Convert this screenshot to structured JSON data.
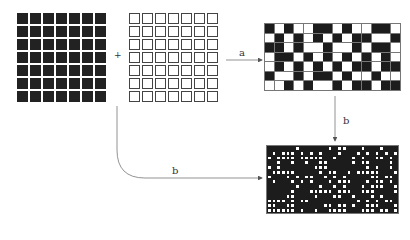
{
  "diagram": {
    "operator": "+",
    "arrow_a_label": "a",
    "arrow_b_down_label": "b",
    "arrow_b_curve_label": "b",
    "colors": {
      "black": "#1c1c1c",
      "white": "#ffffff",
      "line": "#777777"
    },
    "grids": {
      "input_black": {
        "rows": 7,
        "cols": 7,
        "fill": "black"
      },
      "input_white": {
        "rows": 7,
        "cols": 7,
        "fill": "white"
      },
      "result_a": {
        "rows": 7,
        "cols": 14,
        "pattern": [
          "BWBWWBBWBWWBBW",
          "WBWBWBWBWBBWWB",
          "BBWBWWBWWBWBBW",
          "WBBWBWBWBWBWBW",
          "WBWBWBWBWBBWBB",
          "BWWBWBBWBWWBWW",
          "WWBWBWWBWBBWBB"
        ]
      },
      "result_b": {
        "rows": 14,
        "cols": 28,
        "fill": "random-checker"
      }
    }
  }
}
